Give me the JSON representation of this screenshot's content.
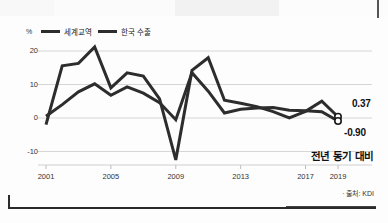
{
  "chart_data": {
    "type": "line",
    "title": "",
    "subtitle": "",
    "xlabel": "",
    "ylabel": "%",
    "unit_label": "%",
    "xlim": [
      2001,
      2019
    ],
    "ylim": [
      -15,
      23
    ],
    "yticks": [
      20,
      10,
      0,
      -10
    ],
    "ytick_labels": [
      "20",
      "10",
      "0",
      "-10"
    ],
    "xticks": [
      2001,
      2005,
      2009,
      2013,
      2017,
      2019
    ],
    "xtick_labels": [
      "2001",
      "2005",
      "2009",
      "2013",
      "2017",
      "2019"
    ],
    "grid": true,
    "grid_axis": "y",
    "legend_position": "top-left",
    "x": [
      2001,
      2002,
      2003,
      2004,
      2005,
      2006,
      2007,
      2008,
      2009,
      2010,
      2011,
      2012,
      2013,
      2014,
      2015,
      2016,
      2017,
      2018,
      2019
    ],
    "series": [
      {
        "name": "세계교역",
        "color": "#2d2d2d",
        "values": [
          -2.0,
          15.6,
          16.3,
          21.2,
          9.0,
          13.5,
          12.5,
          5.7,
          -12.5,
          14.2,
          18.0,
          5.3,
          4.4,
          3.4,
          1.9,
          0.0,
          2.0,
          5.0,
          0.37
        ],
        "end_label": "0.37"
      },
      {
        "name": "한국 수출",
        "color": "#2d2d2d",
        "values": [
          0.5,
          4.0,
          7.8,
          10.2,
          6.8,
          9.3,
          7.4,
          4.6,
          -0.5,
          13.5,
          8.0,
          1.5,
          2.6,
          3.0,
          3.1,
          2.3,
          2.2,
          1.9,
          -0.9
        ],
        "end_label": "-0.90"
      }
    ],
    "annotations": [
      {
        "text": "0.37",
        "role": "end-value-world-trade"
      },
      {
        "text": "-0.90",
        "role": "end-value-korea-exports"
      },
      {
        "text": "전년 동기 대비",
        "role": "axis-note"
      }
    ],
    "source": "· 출처: KDI"
  },
  "legend": {
    "unit": "%",
    "items": [
      {
        "label": "세계교역"
      },
      {
        "label": "한국 수출"
      }
    ]
  },
  "footer": {
    "note": "전년 동기 대비",
    "source": "· 출처: KDI"
  }
}
